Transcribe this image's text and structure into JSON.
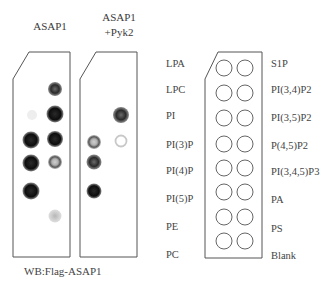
{
  "figure": {
    "headers": {
      "lane1": "ASAP1",
      "lane2_line1": "ASAP1",
      "lane2_line2": "+Pyk2"
    },
    "footer": "WB:Flag-ASAP1",
    "key": {
      "left_labels": [
        "LPA",
        "LPC",
        "PI",
        "PI(3)P",
        "PI(4)P",
        "PI(5)P",
        "PE",
        "PC"
      ],
      "right_labels": [
        "S1P",
        "PI(3,4)P2",
        "PI(3,5)P2",
        "P(4,5)P2",
        "PI(3,4,5)P3",
        "PA",
        "PS",
        "Blank"
      ]
    },
    "strips": [
      {
        "name": "ASAP1",
        "spots": [
          {
            "lipid": "LPC",
            "col": "right",
            "intensity": "strong-grey"
          },
          {
            "lipid": "PI",
            "col": "right",
            "intensity": "strong"
          },
          {
            "lipid": "PI(3)P",
            "col": "left",
            "intensity": "strong"
          },
          {
            "lipid": "PI(3)P",
            "col": "right",
            "intensity": "strong"
          },
          {
            "lipid": "PI(4)P",
            "col": "left",
            "intensity": "strong"
          },
          {
            "lipid": "PI(4)P",
            "col": "right",
            "intensity": "medium-ring"
          },
          {
            "lipid": "PI(5)P",
            "col": "left",
            "intensity": "strong"
          },
          {
            "lipid": "PE",
            "col": "right",
            "intensity": "weak"
          }
        ]
      },
      {
        "name": "ASAP1 +Pyk2",
        "spots": [
          {
            "lipid": "PI",
            "col": "right",
            "intensity": "strong"
          },
          {
            "lipid": "PI(3)P",
            "col": "left",
            "intensity": "medium-ring"
          },
          {
            "lipid": "PI(3)P",
            "col": "right",
            "intensity": "faint-ring"
          },
          {
            "lipid": "PI(4)P",
            "col": "left",
            "intensity": "strong"
          },
          {
            "lipid": "PI(5)P",
            "col": "left",
            "intensity": "strong"
          }
        ]
      }
    ],
    "colors": {
      "outline": "#555555",
      "spot_dark": "#111111",
      "spot_grey": "#9a9a9a",
      "key_circle": "#666666"
    }
  }
}
